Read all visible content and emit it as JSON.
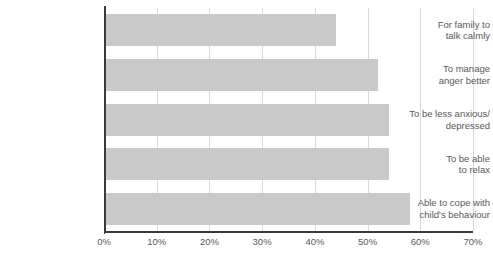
{
  "chart_data": {
    "type": "bar",
    "orientation": "horizontal",
    "title": "",
    "xlabel": "",
    "ylabel": "",
    "categories": [
      "For family to talk calmly",
      "To manage anger better",
      "To be less anxious/ depressed",
      "To be able to relax",
      "Able to cope with child's behaviour"
    ],
    "category_lines": [
      [
        "For family to",
        "talk calmly"
      ],
      [
        "To manage",
        "anger better"
      ],
      [
        "To be less anxious/",
        "depressed"
      ],
      [
        "To be able",
        "to relax"
      ],
      [
        "Able to cope with",
        "child's behaviour"
      ]
    ],
    "values": [
      44,
      52,
      54,
      54,
      58
    ],
    "value_unit": "%",
    "xlim": [
      0,
      70
    ],
    "xticks": [
      0,
      10,
      20,
      30,
      40,
      50,
      60,
      70
    ],
    "xtick_labels": [
      "0%",
      "10%",
      "20%",
      "30%",
      "40%",
      "50%",
      "60%",
      "70%"
    ],
    "grid": true,
    "legend": null,
    "bar_color": "#c9c9c9",
    "axis_color": "#3a3a3a",
    "grid_color": "#d9d9d9",
    "label_color": "#58585a"
  }
}
